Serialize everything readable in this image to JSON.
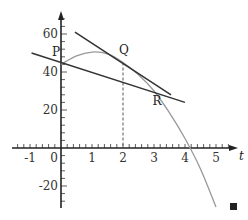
{
  "chart_data": {
    "type": "line",
    "title": "",
    "xlabel": "t",
    "ylabel": "",
    "xlim": [
      -1.4,
      5.6
    ],
    "ylim": [
      -32,
      72
    ],
    "grid": false,
    "x_ticks": [
      -1,
      0,
      1,
      2,
      3,
      4,
      5
    ],
    "x_tick_labels": [
      "-1",
      "0",
      "1",
      "2",
      "3",
      "4",
      "5"
    ],
    "y_ticks": [
      -20,
      20,
      40,
      60
    ],
    "y_tick_labels": [
      "-20",
      "20",
      "40",
      "60"
    ],
    "x_minor_step": 0.2,
    "y_minor_step": 4,
    "series": [
      {
        "name": "curve",
        "color": "#999999",
        "x": [
          0,
          0.5,
          1,
          1.5,
          2,
          2.5,
          3,
          3.5,
          4,
          4.5,
          5
        ],
        "values": [
          44,
          48.5,
          50.5,
          49.5,
          45,
          38.5,
          30,
          18.5,
          5,
          -11,
          -31
        ]
      },
      {
        "name": "tangent at Q",
        "color": "#333333",
        "x": [
          0.45,
          3.55
        ],
        "values": [
          61,
          28
        ]
      },
      {
        "name": "secant PR",
        "color": "#333333",
        "x": [
          -0.95,
          4
        ],
        "values": [
          50,
          24
        ]
      }
    ],
    "points": [
      {
        "label": "P",
        "x": 0,
        "y": 44
      },
      {
        "label": "Q",
        "x": 2,
        "y": 45
      },
      {
        "label": "R",
        "x": 3.05,
        "y": 30
      }
    ],
    "annotations": [
      {
        "type": "dashed-vertical",
        "x": 2,
        "from": 0,
        "to": 45
      },
      {
        "type": "end-of-proof-square",
        "position": "bottom-right"
      }
    ]
  }
}
